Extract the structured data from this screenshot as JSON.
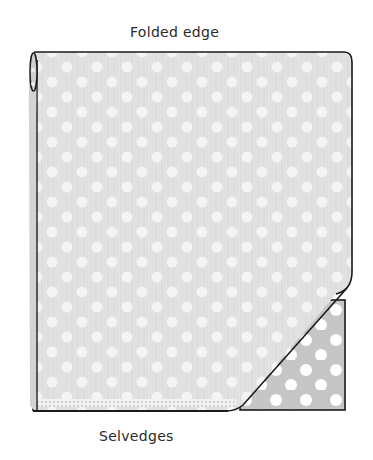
{
  "diagram": {
    "labels": {
      "top": "Folded edge",
      "bottom": "Selvedges"
    },
    "fabric": {
      "pattern": "polka-dot",
      "wrong_side_color": "#e4e4e4",
      "right_side_color": "#c9c9c9",
      "dot_color": "#ffffff",
      "outline_color": "#1a1a1a"
    },
    "parts": [
      {
        "name": "folded-fabric-body",
        "description": "Main fabric folded in half, wrong side up"
      },
      {
        "name": "fold-roll",
        "description": "Rolled folded edge on left side"
      },
      {
        "name": "turned-corner",
        "description": "Bottom-right corner folded back showing right side"
      },
      {
        "name": "selvedge-strip",
        "description": "Dotted selvedge edge along bottom"
      }
    ]
  }
}
